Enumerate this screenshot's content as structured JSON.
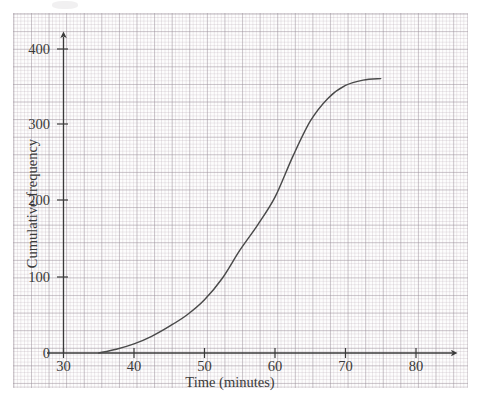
{
  "chart_data": {
    "type": "line",
    "title": "",
    "xlabel": "Time (minutes)",
    "ylabel": "Cumulative frequency",
    "xlim": [
      30,
      84
    ],
    "ylim": [
      0,
      420
    ],
    "xticks": [
      30,
      40,
      50,
      60,
      70,
      80
    ],
    "yticks": [
      0,
      100,
      200,
      300,
      400
    ],
    "xtick_labels": [
      "30",
      "40",
      "50",
      "60",
      "70",
      "80"
    ],
    "ytick_labels": [
      "0",
      "100",
      "200",
      "300",
      "400"
    ],
    "grid": "graph-paper minor and major grid",
    "legend": "none",
    "series": [
      {
        "name": "Cumulative frequency curve",
        "color": "#4a4a4a",
        "x": [
          35,
          37.5,
          40,
          42.5,
          45,
          47.5,
          50,
          52.5,
          55,
          57.5,
          60,
          62.5,
          65,
          67.5,
          70,
          72.5,
          75
        ],
        "values": [
          0,
          5,
          12,
          22,
          35,
          50,
          70,
          98,
          135,
          168,
          205,
          258,
          305,
          335,
          352,
          359,
          361
        ]
      }
    ],
    "annotations": []
  },
  "axes": {
    "y_title": "Cumulative frequency",
    "x_title": "Time (minutes)",
    "y_tick_400": "400",
    "y_tick_300": "300",
    "y_tick_200": "200",
    "y_tick_100": "100",
    "y_tick_0": "0",
    "x_tick_30": "30",
    "x_tick_40": "40",
    "x_tick_50": "50",
    "x_tick_60": "60",
    "x_tick_70": "70",
    "x_tick_80": "80"
  },
  "colors": {
    "curve": "#4a4a4a",
    "axis": "#3a3a3a",
    "grid_minor": "#b4a5af",
    "grid_major": "#968c96",
    "paper": "#fdfdfd",
    "text": "#3a3a3a"
  }
}
